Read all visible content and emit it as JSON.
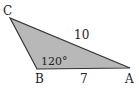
{
  "diagram": {
    "type": "triangle",
    "fill_color": "#b8b8b8",
    "stroke_color": "#333333",
    "vertices": [
      {
        "name": "C",
        "label": "C",
        "x": 10,
        "y": 18
      },
      {
        "name": "B",
        "label": "B",
        "x": 37,
        "y": 69
      },
      {
        "name": "A",
        "label": "A",
        "x": 130,
        "y": 68
      }
    ],
    "side_labels": {
      "CA": "10",
      "BA": "7"
    },
    "angle_labels": {
      "B": "120°"
    }
  }
}
